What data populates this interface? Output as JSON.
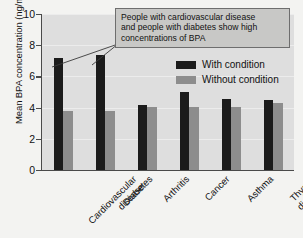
{
  "chart_data": {
    "type": "bar",
    "title": "",
    "xlabel": "",
    "ylabel": "Mean BPA concentration (ng/ml)",
    "ylim": [
      0,
      10
    ],
    "yticks": [
      "0",
      "2",
      "4",
      "6",
      "8",
      "10"
    ],
    "grid": true,
    "legend_position": "upper-right-inside",
    "categories": [
      "Cardiovascular disease",
      "Diabetes",
      "Arthritis",
      "Cancer",
      "Asthma",
      "Thyroid disease"
    ],
    "category_lines": [
      [
        "Cardiovascular",
        "disease"
      ],
      [
        "Diabetes"
      ],
      [
        "Arthritis"
      ],
      [
        "Cancer"
      ],
      [
        "Asthma"
      ],
      [
        "Thyroid",
        "disease"
      ]
    ],
    "series": [
      {
        "name": "With condition",
        "color": "#1b1b1b",
        "values": [
          7.2,
          7.35,
          4.15,
          5.0,
          4.55,
          4.5
        ]
      },
      {
        "name": "Without condition",
        "color": "#8d8d8d",
        "values": [
          3.8,
          3.8,
          4.05,
          4.05,
          4.05,
          4.3
        ]
      }
    ],
    "annotations": [
      {
        "text": "People with cardiovascular disease and people with diabetes show high concentrations of BPA",
        "lines": [
          "People with cardiovascular disease",
          "and people with diabetes show high",
          "concentrations of BPA"
        ],
        "points_to": [
          "Cardiovascular disease",
          "Diabetes"
        ]
      }
    ]
  },
  "legend": {
    "items": [
      {
        "label": "With condition",
        "color": "#1b1b1b"
      },
      {
        "label": "Without condition",
        "color": "#8d8d8d"
      }
    ]
  },
  "colors": {
    "with_condition": "#1b1b1b",
    "without_condition": "#8d8d8d",
    "plot_background": "#dedede",
    "figure_background": "#f3f3f1",
    "annotation_background": "#c8c8c6",
    "axis": "#4a4a4a"
  }
}
